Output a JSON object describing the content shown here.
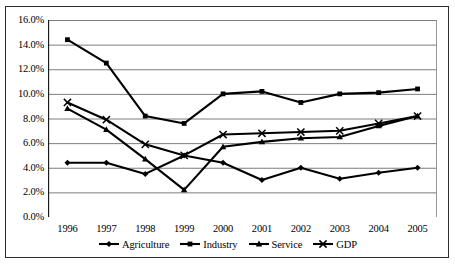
{
  "chart_data": {
    "type": "line",
    "title": "",
    "xlabel": "",
    "ylabel": "",
    "categories": [
      "1996",
      "1997",
      "1998",
      "1999",
      "2000",
      "2001",
      "2002",
      "2003",
      "2004",
      "2005"
    ],
    "ylim": [
      0,
      16
    ],
    "y_ticks": [
      "0.0%",
      "2.0%",
      "4.0%",
      "6.0%",
      "8.0%",
      "10.0%",
      "12.0%",
      "14.0%",
      "16.0%"
    ],
    "y_tick_values": [
      0,
      2,
      4,
      6,
      8,
      10,
      12,
      14,
      16
    ],
    "grid": true,
    "legend_position": "bottom",
    "units": "percent",
    "series": [
      {
        "name": "Agriculture",
        "marker": "diamond",
        "color": "#000000",
        "values": [
          4.4,
          4.4,
          3.5,
          5.0,
          4.4,
          3.0,
          4.0,
          3.1,
          3.6,
          4.0
        ]
      },
      {
        "name": "Industry",
        "marker": "square",
        "color": "#000000",
        "values": [
          14.4,
          12.5,
          8.2,
          7.6,
          10.0,
          10.2,
          9.3,
          10.0,
          10.1,
          10.4
        ]
      },
      {
        "name": "Service",
        "marker": "triangle",
        "color": "#000000",
        "values": [
          8.8,
          7.1,
          4.7,
          2.2,
          5.7,
          6.1,
          6.4,
          6.5,
          7.4,
          8.2
        ]
      },
      {
        "name": "GDP",
        "marker": "cross",
        "color": "#000000",
        "values": [
          9.3,
          7.9,
          5.9,
          5.0,
          6.7,
          6.8,
          6.9,
          7.0,
          7.6,
          8.2
        ]
      }
    ]
  },
  "legend": {
    "items": [
      {
        "label": "Agriculture",
        "marker": "diamond"
      },
      {
        "label": "Industry",
        "marker": "square"
      },
      {
        "label": "Service",
        "marker": "triangle"
      },
      {
        "label": "GDP",
        "marker": "cross"
      }
    ]
  }
}
